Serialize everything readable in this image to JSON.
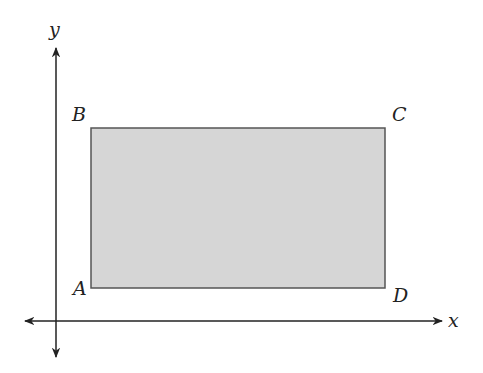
{
  "diagram": {
    "axes": {
      "x_label": "x",
      "y_label": "y"
    },
    "rectangle": {
      "fill": "#d6d6d6",
      "stroke": "#555555",
      "vertices": {
        "A": "A",
        "B": "B",
        "C": "C",
        "D": "D"
      }
    }
  }
}
